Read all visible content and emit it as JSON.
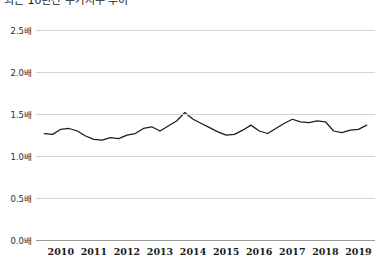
{
  "title": "최근 10년간 주가지수 추이",
  "chart_data": {
    "type": "line",
    "title": "최근 10년간 주가지수 추이",
    "xlabel": "",
    "ylabel": "",
    "unit": "배",
    "ylim": [
      0.0,
      2.6
    ],
    "yticks": [
      0.0,
      0.5,
      1.0,
      1.5,
      2.0,
      2.5
    ],
    "ytick_labels": [
      "0.0배",
      "0.5배",
      "1.0배",
      "1.5배",
      "2.0배",
      "2.5배"
    ],
    "grid": true,
    "legend": "none",
    "xlim": [
      2009.75,
      2020.0
    ],
    "xtick_years": [
      2010,
      2011,
      2012,
      2013,
      2014,
      2015,
      2016,
      2017,
      2018,
      2019
    ],
    "xtick_labels": [
      "2010",
      "2011",
      "2012",
      "2013",
      "2014",
      "2015",
      "2016",
      "2017",
      "2018",
      "2019"
    ],
    "line_color": "#1c1c1c",
    "series": [
      {
        "name": "주가지수",
        "x": [
          2010.0,
          2010.25,
          2010.5,
          2010.75,
          2011.0,
          2011.25,
          2011.5,
          2011.75,
          2012.0,
          2012.25,
          2012.5,
          2012.75,
          2013.0,
          2013.25,
          2013.5,
          2013.75,
          2014.0,
          2014.25,
          2014.5,
          2014.75,
          2015.0,
          2015.25,
          2015.5,
          2015.75,
          2016.0,
          2016.25,
          2016.5,
          2016.75,
          2017.0,
          2017.25,
          2017.5,
          2017.75,
          2018.0,
          2018.25,
          2018.5,
          2018.75,
          2019.0,
          2019.25,
          2019.5,
          2019.75
        ],
        "values": [
          1.27,
          1.26,
          1.32,
          1.33,
          1.3,
          1.24,
          1.2,
          1.19,
          1.22,
          1.21,
          1.25,
          1.27,
          1.33,
          1.35,
          1.3,
          1.36,
          1.42,
          1.52,
          1.44,
          1.39,
          1.34,
          1.29,
          1.25,
          1.26,
          1.31,
          1.37,
          1.3,
          1.27,
          1.33,
          1.39,
          1.44,
          1.41,
          1.4,
          1.42,
          1.41,
          1.3,
          1.28,
          1.31,
          1.32,
          1.37
        ]
      }
    ]
  }
}
